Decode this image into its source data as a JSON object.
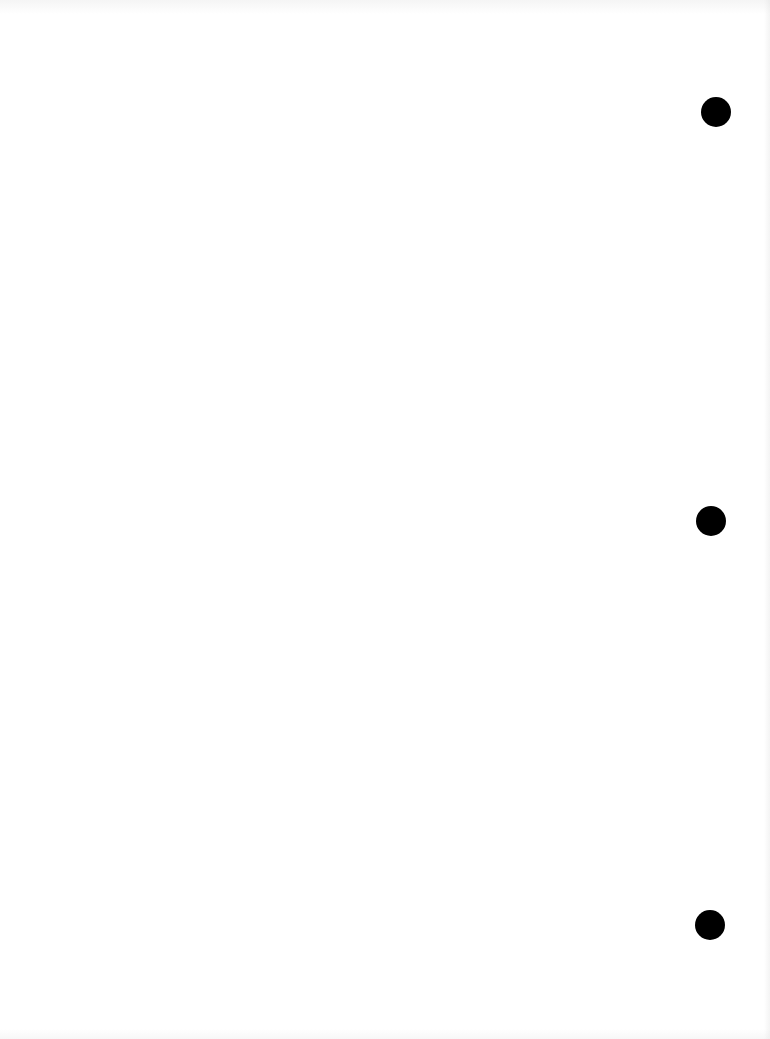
{
  "document": {
    "background_color": "#ffffff",
    "text_content": "",
    "punch_holes": [
      {
        "cx": 716,
        "cy": 112,
        "diameter": 30,
        "color": "#000000"
      },
      {
        "cx": 711,
        "cy": 521,
        "diameter": 30,
        "color": "#000000"
      },
      {
        "cx": 710,
        "cy": 925,
        "diameter": 30,
        "color": "#000000"
      }
    ]
  }
}
